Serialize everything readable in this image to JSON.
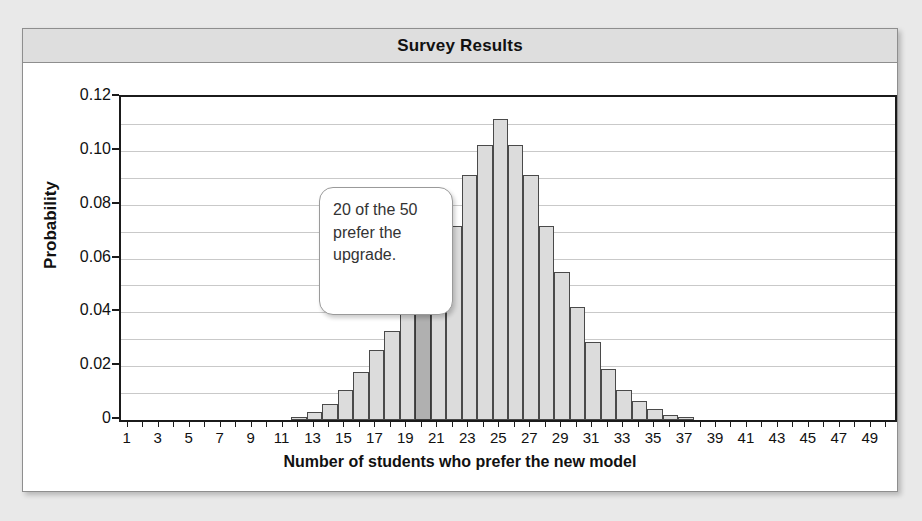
{
  "chart_data": {
    "type": "bar",
    "title": "Survey Results",
    "xlabel": "Number of students who prefer the new model",
    "ylabel": "Probability",
    "xlim": [
      0,
      50
    ],
    "ylim": [
      0,
      0.12
    ],
    "grid": true,
    "legend": "none",
    "ytick_labels": [
      "0",
      "0.02",
      "0.04",
      "0.06",
      "0.08",
      "0.10",
      "0.12"
    ],
    "ytick_values": [
      0,
      0.02,
      0.04,
      0.06,
      0.08,
      0.1,
      0.12
    ],
    "minor_gridline_step": 0.01,
    "xtick_labels": [
      "1",
      "3",
      "5",
      "7",
      "9",
      "11",
      "13",
      "15",
      "17",
      "19",
      "21",
      "23",
      "25",
      "27",
      "29",
      "31",
      "33",
      "35",
      "37",
      "39",
      "41",
      "43",
      "45",
      "47",
      "49"
    ],
    "xtick_values": [
      1,
      3,
      5,
      7,
      9,
      11,
      13,
      15,
      17,
      19,
      21,
      23,
      25,
      27,
      29,
      31,
      33,
      35,
      37,
      39,
      41,
      43,
      45,
      47,
      49
    ],
    "categories": [
      1,
      2,
      3,
      4,
      5,
      6,
      7,
      8,
      9,
      10,
      11,
      12,
      13,
      14,
      15,
      16,
      17,
      18,
      19,
      20,
      21,
      22,
      23,
      24,
      25,
      26,
      27,
      28,
      29,
      30,
      31,
      32,
      33,
      34,
      35,
      36,
      37,
      38,
      39,
      40,
      41,
      42,
      43,
      44,
      45,
      46,
      47,
      48,
      49,
      50
    ],
    "values": [
      0,
      0,
      0,
      0,
      0,
      0,
      0,
      0,
      0,
      0,
      0,
      0.001,
      0.003,
      0.006,
      0.011,
      0.018,
      0.026,
      0.033,
      0.042,
      0.042,
      0.055,
      0.072,
      0.091,
      0.102,
      0.112,
      0.102,
      0.091,
      0.072,
      0.055,
      0.042,
      0.029,
      0.019,
      0.011,
      0.007,
      0.004,
      0.002,
      0.001,
      0,
      0,
      0,
      0,
      0,
      0,
      0,
      0,
      0,
      0,
      0,
      0,
      0
    ],
    "highlight_category": 20,
    "highlight_value": 0.042,
    "bar_color": "#dcdcdc",
    "highlight_color": "#b0b0b0",
    "bar_edge_color": "#4a4a4a",
    "annotation": {
      "text": "20 of the 50\nprefer the\nupgrade.",
      "points_to_category": 20
    }
  }
}
